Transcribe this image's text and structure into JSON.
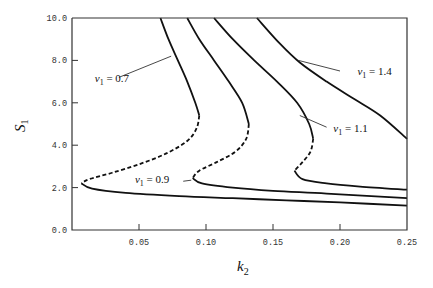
{
  "chart_data": {
    "type": "line",
    "title": "",
    "xlabel": "k2",
    "xlabel_main": "k",
    "xlabel_sub": "2",
    "ylabel": "S1",
    "ylabel_main": "S",
    "ylabel_sub": "1",
    "xlim": [
      0.0,
      0.25
    ],
    "ylim": [
      0.0,
      10.0
    ],
    "x_ticks": [
      0.05,
      0.1,
      0.15,
      0.2,
      0.25
    ],
    "x_tick_labels": [
      "0.05",
      "0.10",
      "0.15",
      "0.20",
      "0.25"
    ],
    "y_ticks": [
      0.0,
      2.0,
      4.0,
      6.0,
      8.0,
      10.0
    ],
    "y_tick_labels": [
      "0.0",
      "2.0",
      "4.0",
      "6.0",
      "8.0",
      "10.0"
    ],
    "grid": false,
    "legend": "inline annotations",
    "line_color": "#111111",
    "series": [
      {
        "name": "v1 = 0.7",
        "label_text": "= 0.7",
        "label_pos": {
          "k": 0.017,
          "S": 7.0
        },
        "leader": [
          [
            0.035,
            7.2
          ],
          [
            0.074,
            8.2
          ]
        ],
        "segments": [
          {
            "style": "solid",
            "points": [
              [
                0.066,
                10.0
              ],
              [
                0.072,
                9.0
              ],
              [
                0.079,
                8.0
              ],
              [
                0.086,
                7.0
              ],
              [
                0.092,
                6.0
              ],
              [
                0.095,
                5.4
              ]
            ]
          },
          {
            "style": "dashed",
            "points": [
              [
                0.095,
                5.4
              ],
              [
                0.093,
                4.8
              ],
              [
                0.086,
                4.2
              ],
              [
                0.07,
                3.6
              ],
              [
                0.05,
                3.1
              ],
              [
                0.03,
                2.7
              ],
              [
                0.013,
                2.4
              ],
              [
                0.007,
                2.2
              ]
            ]
          },
          {
            "style": "solid",
            "points": [
              [
                0.007,
                2.2
              ],
              [
                0.015,
                1.95
              ],
              [
                0.04,
                1.75
              ],
              [
                0.08,
                1.6
              ],
              [
                0.12,
                1.5
              ],
              [
                0.16,
                1.4
              ],
              [
                0.2,
                1.3
              ],
              [
                0.25,
                1.15
              ]
            ]
          }
        ]
      },
      {
        "name": "v1 = 0.9",
        "label_text": "= 0.9",
        "label_pos": {
          "k": 0.047,
          "S": 2.2
        },
        "leader": [
          [
            0.083,
            2.3
          ],
          [
            0.089,
            2.35
          ]
        ],
        "segments": [
          {
            "style": "solid",
            "points": [
              [
                0.086,
                10.0
              ],
              [
                0.095,
                9.0
              ],
              [
                0.106,
                8.0
              ],
              [
                0.117,
                7.0
              ],
              [
                0.127,
                6.0
              ],
              [
                0.132,
                5.0
              ]
            ]
          },
          {
            "style": "dashed",
            "points": [
              [
                0.132,
                5.0
              ],
              [
                0.13,
                4.3
              ],
              [
                0.122,
                3.7
              ],
              [
                0.108,
                3.2
              ],
              [
                0.095,
                2.8
              ],
              [
                0.09,
                2.45
              ]
            ]
          },
          {
            "style": "solid",
            "points": [
              [
                0.09,
                2.45
              ],
              [
                0.097,
                2.2
              ],
              [
                0.12,
                2.0
              ],
              [
                0.15,
                1.85
              ],
              [
                0.19,
                1.72
              ],
              [
                0.25,
                1.5
              ]
            ]
          }
        ]
      },
      {
        "name": "v1 = 1.1",
        "label_text": "= 1.1",
        "label_pos": {
          "k": 0.195,
          "S": 4.6
        },
        "leader": [
          [
            0.17,
            5.4
          ],
          [
            0.19,
            4.85
          ]
        ],
        "segments": [
          {
            "style": "solid",
            "points": [
              [
                0.106,
                10.0
              ],
              [
                0.12,
                9.0
              ],
              [
                0.136,
                8.0
              ],
              [
                0.153,
                7.0
              ],
              [
                0.168,
                6.0
              ],
              [
                0.177,
                5.0
              ],
              [
                0.18,
                4.3
              ]
            ]
          },
          {
            "style": "dashed",
            "points": [
              [
                0.18,
                4.3
              ],
              [
                0.178,
                3.7
              ],
              [
                0.172,
                3.2
              ],
              [
                0.166,
                2.8
              ]
            ]
          },
          {
            "style": "solid",
            "points": [
              [
                0.166,
                2.8
              ],
              [
                0.172,
                2.4
              ],
              [
                0.19,
                2.2
              ],
              [
                0.215,
                2.05
              ],
              [
                0.25,
                1.9
              ]
            ]
          }
        ]
      },
      {
        "name": "v1 = 1.4",
        "label_text": "= 1.4",
        "label_pos": {
          "k": 0.213,
          "S": 7.3
        },
        "leader": [
          [
            0.169,
            8.0
          ],
          [
            0.2,
            7.5
          ]
        ],
        "segments": [
          {
            "style": "solid",
            "points": [
              [
                0.138,
                10.0
              ],
              [
                0.155,
                8.8
              ],
              [
                0.17,
                7.9
              ],
              [
                0.19,
                7.0
              ],
              [
                0.21,
                6.2
              ],
              [
                0.23,
                5.4
              ],
              [
                0.25,
                4.3
              ]
            ]
          }
        ]
      }
    ]
  }
}
